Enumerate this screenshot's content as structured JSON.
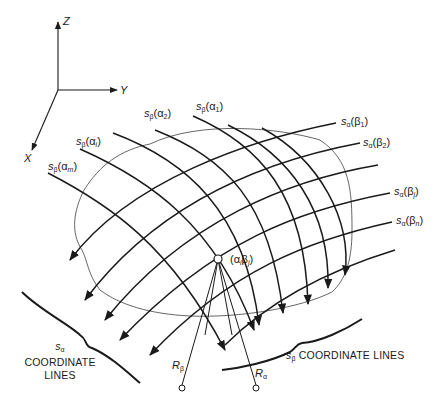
{
  "axes": {
    "z_label": "Z",
    "y_label": "Y",
    "x_label": "X"
  },
  "beta_line_labels": [
    {
      "base": "s",
      "base_sub": "β",
      "arg": "α",
      "arg_sub": "1"
    },
    {
      "base": "s",
      "base_sub": "β",
      "arg": "α",
      "arg_sub": "2"
    },
    {
      "base": "s",
      "base_sub": "β",
      "arg": "α",
      "arg_sub": "i"
    },
    {
      "base": "s",
      "base_sub": "β",
      "arg": "α",
      "arg_sub": "m"
    }
  ],
  "alpha_line_labels": [
    {
      "base": "s",
      "base_sub": "α",
      "arg": "β",
      "arg_sub": "1"
    },
    {
      "base": "s",
      "base_sub": "α",
      "arg": "β",
      "arg_sub": "2"
    },
    {
      "base": "s",
      "base_sub": "α",
      "arg": "β",
      "arg_sub": "j"
    },
    {
      "base": "s",
      "base_sub": "α",
      "arg": "β",
      "arg_sub": "n"
    }
  ],
  "point": {
    "arg1": "α",
    "arg1_sub": "i",
    "arg2": "β",
    "arg2_sub": "j"
  },
  "radii": {
    "r_beta": {
      "base": "R",
      "sub": "β"
    },
    "r_alpha": {
      "base": "R",
      "sub": "α"
    }
  },
  "captions": {
    "s_alpha": {
      "base": "s",
      "sub": "α",
      "line1": "COORDINATE",
      "line2": "LINES"
    },
    "s_beta": {
      "base": "s",
      "sub": "β",
      "text": "COORDINATE LINES"
    }
  },
  "colors": {
    "ink": "#1a1a1a",
    "boundary": "#555555"
  }
}
